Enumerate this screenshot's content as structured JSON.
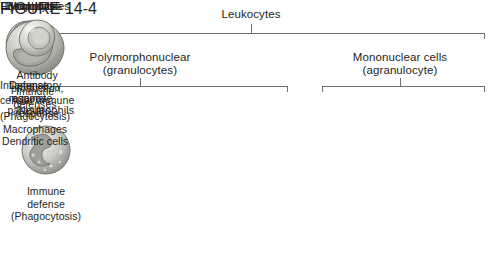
{
  "figure": {
    "root_label": "Leukocytes",
    "groups": [
      {
        "line1": "Polymorphonuclear",
        "line2": "(granulocytes)"
      },
      {
        "line1": "Mononuclear cells",
        "line2": "(agranulocyte)"
      }
    ],
    "cells": [
      {
        "name": "Neutrophils",
        "art": "neutrophil-cell-illustration",
        "desc": [
          "Immune",
          "defense",
          "(Phagocytosis)"
        ]
      },
      {
        "name": "Eosinophils",
        "art": "eosinophil-cell-illustration",
        "desc": [
          "Defense",
          "against",
          "parasites"
        ]
      },
      {
        "name": "Basophils",
        "art": "basophil-cell-illustration",
        "desc": [
          "Inflammatory",
          "response"
        ]
      },
      {
        "name": "Monocytes",
        "art": "monocyte-cell-illustration",
        "desc": [
          "Immune",
          "defenses",
          "(Phagocytosis)",
          "Macrophages",
          "Dendritic cells"
        ]
      },
      {
        "name": "Lymphocytes",
        "art": "lymphocyte-cell-illustration",
        "desc": [
          "Antibody",
          "production,",
          "cellular immune",
          "response"
        ]
      }
    ],
    "caption": {
      "word": "FIGURE",
      "number": "14-4"
    },
    "colors": {
      "text": "#231f20",
      "bracket": "#6d6e71",
      "caption_square": "#8c8c8c",
      "caption_rule": "#58595b",
      "cell_light": "#e8e8e6",
      "cell_mid": "#b9b9b5",
      "cell_dark": "#7d7d7a"
    }
  }
}
